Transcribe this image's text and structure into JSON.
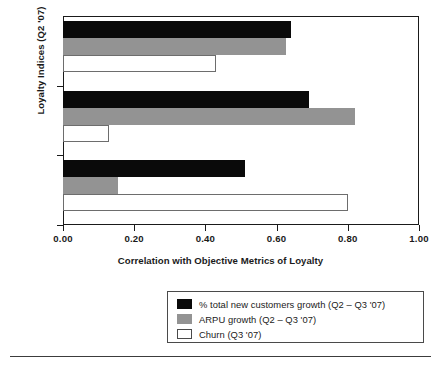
{
  "chart_data": {
    "type": "bar",
    "orientation": "horizontal",
    "title": "",
    "xlabel": "Correlation with Objective Metrics of Loyalty",
    "ylabel": "Loyalty Indices (Q2 '07)",
    "categories": [
      "ALI",
      "PLI",
      "RLI"
    ],
    "xlim": [
      0.0,
      1.0
    ],
    "xticks": [
      0.0,
      0.2,
      0.4,
      0.6,
      0.8,
      1.0
    ],
    "xtick_labels": [
      "0.00",
      "0.20",
      "0.40",
      "0.60",
      "0.80",
      "1.00"
    ],
    "grid": false,
    "legend_position": "below",
    "series": [
      {
        "name": "% total new customers growth (Q2 – Q3 '07)",
        "color": "#0a0a0a",
        "values": [
          0.64,
          0.69,
          0.51
        ]
      },
      {
        "name": "ARPU growth (Q2 – Q3 '07)",
        "color": "#939393",
        "values": [
          0.625,
          0.82,
          0.155
        ]
      },
      {
        "name": "Churn (Q3 '07)",
        "color": "#ffffff",
        "values": [
          0.43,
          0.13,
          0.8
        ]
      }
    ]
  },
  "axes": {
    "y_title": "Loyalty Indices (Q2 '07)",
    "x_title": "Correlation with Objective Metrics of Loyalty",
    "category_labels": [
      "ALI",
      "PLI",
      "RLI"
    ],
    "x_tick_labels": [
      "0.00",
      "0.20",
      "0.40",
      "0.60",
      "0.80",
      "1.00"
    ]
  },
  "legend": {
    "entries": [
      {
        "label": "% total new customers growth (Q2 – Q3 '07)",
        "swatch": "black-swatch"
      },
      {
        "label": "ARPU growth (Q2 – Q3 '07)",
        "swatch": "gray-swatch"
      },
      {
        "label": "Churn (Q3 '07)",
        "swatch": "white-swatch"
      }
    ]
  },
  "colors": {
    "series_black": "#0a0a0a",
    "series_gray": "#939393",
    "series_white": "#ffffff",
    "axis": "#1a1a1a"
  }
}
